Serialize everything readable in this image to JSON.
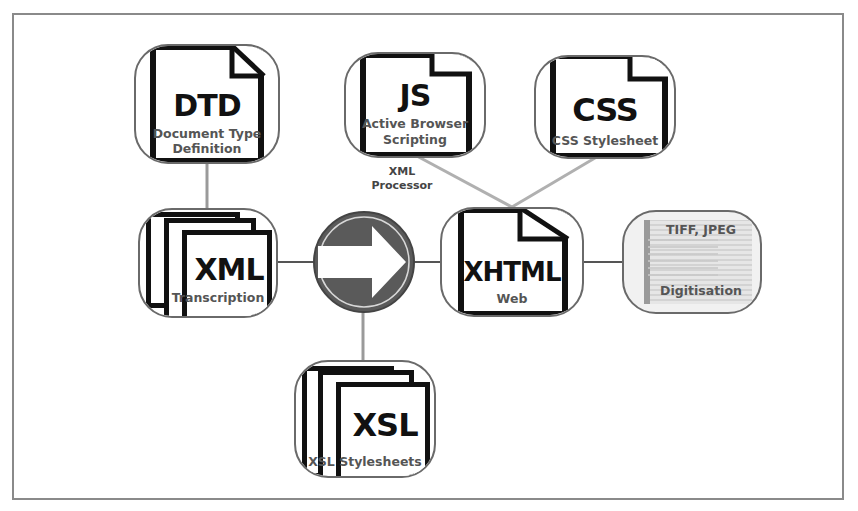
{
  "diagram": {
    "colors": {
      "frame": "#8a8a8a",
      "node_border": "#6a6a6a",
      "connector_dark": "#555555",
      "connector_light": "#b0b0b0",
      "processor_fill": "#5a5a5a",
      "text_big": "#111111",
      "text_sub": "#555555"
    },
    "nodes": {
      "dtd": {
        "label": "DTD",
        "caption_line1": "Document Type",
        "caption_line2": "Definition",
        "icon": "document-icon"
      },
      "js": {
        "label": "JS",
        "caption_line1": "Active Browser",
        "caption_line2": "Scripting",
        "icon": "document-icon"
      },
      "css": {
        "label": "CSS",
        "caption_line1": "CSS Stylesheet",
        "icon": "document-icon"
      },
      "xml": {
        "label": "XML",
        "caption_line1": "Transcription",
        "icon": "stacked-documents-icon"
      },
      "processor": {
        "label_line1": "XML",
        "label_line2": "Processor",
        "icon": "right-arrow-icon"
      },
      "xhtml": {
        "label": "XHTML",
        "caption_line1": "Web",
        "icon": "document-icon"
      },
      "digitisation": {
        "caption_top": "TIFF, JPEG",
        "caption_bottom": "Digitisation",
        "icon": "scanned-image-icon"
      },
      "xsl": {
        "label": "XSL",
        "caption_line1": "XSL Stylesheets",
        "icon": "stacked-documents-icon"
      }
    },
    "edges": [
      {
        "from": "dtd",
        "to": "xml"
      },
      {
        "from": "xml",
        "to": "processor"
      },
      {
        "from": "xsl",
        "to": "processor"
      },
      {
        "from": "processor",
        "to": "xhtml"
      },
      {
        "from": "js",
        "to": "xhtml"
      },
      {
        "from": "css",
        "to": "xhtml"
      },
      {
        "from": "digitisation",
        "to": "xhtml"
      }
    ]
  }
}
